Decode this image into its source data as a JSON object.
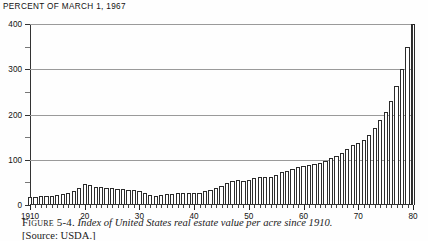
{
  "unit_label": "PERCENT OF MARCH 1, 1967",
  "caption": {
    "figure_number": "Figure 5-4.",
    "text": "Index of United States real estate value per acre since 1910.",
    "source": "[Source: USDA.]"
  },
  "axes": {
    "y_major_ticks": [
      0,
      100,
      200,
      300,
      400
    ],
    "y_minor_ticks": [
      50,
      150,
      250,
      350
    ],
    "x_major_labels": [
      "1910",
      "20",
      "30",
      "40",
      "50",
      "60",
      "70",
      "80"
    ],
    "x_major_years": [
      1910,
      1920,
      1930,
      1940,
      1950,
      1960,
      1970,
      1980
    ]
  },
  "colors": {
    "bar_fill": "#ffffff",
    "bar_stroke": "#2b2b2b",
    "gridline": "#9a9a9a",
    "axis": "#333333",
    "text": "#111111"
  },
  "chart_data": {
    "type": "bar",
    "title": "Index of United States real estate value per acre since 1910.",
    "xlabel": "",
    "ylabel": "PERCENT OF MARCH 1, 1967",
    "ylim": [
      0,
      400
    ],
    "xlim": [
      1910,
      1980
    ],
    "grid": true,
    "legend": null,
    "categories": [
      1910,
      1911,
      1912,
      1913,
      1914,
      1915,
      1916,
      1917,
      1918,
      1919,
      1920,
      1921,
      1922,
      1923,
      1924,
      1925,
      1926,
      1927,
      1928,
      1929,
      1930,
      1931,
      1932,
      1933,
      1934,
      1935,
      1936,
      1937,
      1938,
      1939,
      1940,
      1941,
      1942,
      1943,
      1944,
      1945,
      1946,
      1947,
      1948,
      1949,
      1950,
      1951,
      1952,
      1953,
      1954,
      1955,
      1956,
      1957,
      1958,
      1959,
      1960,
      1961,
      1962,
      1963,
      1964,
      1965,
      1966,
      1967,
      1968,
      1969,
      1970,
      1971,
      1972,
      1973,
      1974,
      1975,
      1976,
      1977,
      1978,
      1979,
      1980
    ],
    "values": [
      17,
      18,
      19,
      20,
      21,
      22,
      24,
      27,
      31,
      38,
      47,
      44,
      40,
      39,
      38,
      37,
      36,
      35,
      34,
      34,
      32,
      27,
      23,
      21,
      23,
      24,
      25,
      26,
      26,
      26,
      26,
      27,
      30,
      34,
      38,
      42,
      48,
      52,
      55,
      53,
      55,
      60,
      62,
      62,
      63,
      67,
      72,
      76,
      80,
      85,
      87,
      88,
      90,
      93,
      98,
      103,
      109,
      114,
      123,
      133,
      137,
      143,
      155,
      170,
      188,
      205,
      230,
      262,
      300,
      350,
      400
    ],
    "value_note": "Index, March 1 1967 = 100"
  }
}
